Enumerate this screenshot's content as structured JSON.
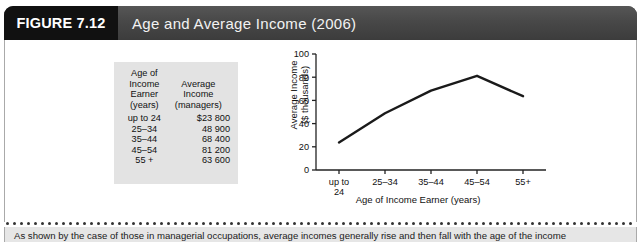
{
  "figure": {
    "tag": "FIGURE 7.12",
    "title": "Age and Average Income (2006)",
    "caption": "As shown by the case of those in managerial occupations, average incomes generally rise and then fall with the age of the income"
  },
  "colors": {
    "tag_background": "#111111",
    "header_background": "#4a4a4a",
    "header_text": "#f2f2f2",
    "table_background": "#e3e3e3",
    "caption_background": "#e6e6e6",
    "line_color": "#1a1a1a"
  },
  "table": {
    "headers": {
      "col1": [
        "Age of",
        "Income",
        "Earner",
        "(years)"
      ],
      "col2": [
        "Average",
        "Income",
        "(managers)"
      ]
    },
    "rows": [
      {
        "category": "up to 24",
        "income": "$23 800"
      },
      {
        "category": "25–34",
        "income": "48 900"
      },
      {
        "category": "35–44",
        "income": "68 400"
      },
      {
        "category": "45–54",
        "income": "81 200"
      },
      {
        "category": "55 +",
        "income": "63 600"
      }
    ]
  },
  "chart_data": {
    "type": "line",
    "title": "",
    "categories": [
      "up to 24",
      "25–34",
      "35–44",
      "45–54",
      "55+"
    ],
    "values": [
      23.8,
      48.9,
      68.4,
      81.2,
      63.6
    ],
    "xlabel": "Age of Income Earner (years)",
    "ylabel": "Average Income ($ thousands)",
    "ylabel_line1": "Average Income",
    "ylabel_line2": "($ thousands)",
    "ylim": [
      0,
      100
    ],
    "yticks": [
      0,
      20,
      40,
      60,
      80,
      100
    ],
    "ytick_labels": [
      "0",
      "20",
      "40",
      "60",
      "80",
      "100"
    ],
    "grid": false,
    "legend": false
  }
}
